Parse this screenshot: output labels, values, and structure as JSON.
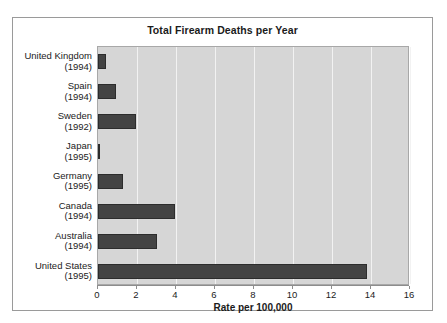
{
  "chart_data": {
    "type": "bar",
    "orientation": "horizontal",
    "title": "Total Firearm Deaths per Year",
    "xlabel": "Rate per 100,000",
    "ylabel": "",
    "xlim": [
      0,
      16
    ],
    "xticks": [
      0,
      2,
      4,
      6,
      8,
      10,
      12,
      14,
      16
    ],
    "grid": "vertical",
    "legend": "none",
    "bar_color": "#434343",
    "plot_background": "#d6d6d6",
    "gridline_color": "#f2f2f2",
    "categories": [
      {
        "country": "United Kingdom",
        "year": "(1994)",
        "value": 0.4
      },
      {
        "country": "Spain",
        "year": "(1994)",
        "value": 0.9
      },
      {
        "country": "Sweden",
        "year": "(1992)",
        "value": 1.95
      },
      {
        "country": "Japan",
        "year": "(1995)",
        "value": 0.1
      },
      {
        "country": "Germany",
        "year": "(1995)",
        "value": 1.3
      },
      {
        "country": "Canada",
        "year": "(1994)",
        "value": 3.95
      },
      {
        "country": "Australia",
        "year": "(1994)",
        "value": 3.05
      },
      {
        "country": "United States",
        "year": "(1995)",
        "value": 13.8
      }
    ]
  }
}
